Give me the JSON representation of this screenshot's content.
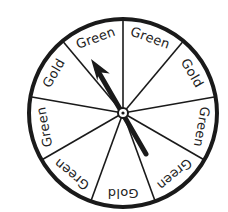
{
  "spinner": {
    "center": [
      123,
      113
    ],
    "radius": 94,
    "rim_color": "#1a1a1a",
    "text_color": "#222222",
    "divider_angles_deg": [
      -90,
      -50,
      -10,
      30,
      70,
      110,
      150,
      190,
      230
    ],
    "sections": [
      {
        "label": "Green",
        "mid_angle": -70
      },
      {
        "label": "Gold",
        "mid_angle": -30
      },
      {
        "label": "Green",
        "mid_angle": 10
      },
      {
        "label": "Green",
        "mid_angle": 50
      },
      {
        "label": "Gold",
        "mid_angle": 90
      },
      {
        "label": "Green",
        "mid_angle": 130
      },
      {
        "label": "Green",
        "mid_angle": 170
      },
      {
        "label": "Gold",
        "mid_angle": 210
      },
      {
        "label": "Green",
        "mid_angle": 250
      }
    ],
    "arrow": {
      "tail": [
        146,
        154
      ],
      "tip": [
        91,
        59
      ],
      "pointing_to": "Green"
    }
  }
}
